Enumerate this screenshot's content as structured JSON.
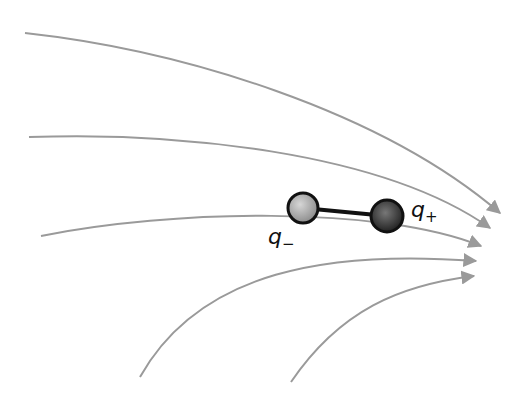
{
  "diagram": {
    "colors": {
      "field_line": "#9a9a9a",
      "rod": "#111111",
      "negative_charge": "#a8a8a8",
      "positive_charge": "#3a3a3a",
      "outline": "#111111"
    },
    "field_lines": [
      {
        "id": "line-1",
        "path": "M25,33 C180,50 380,110 500,213"
      },
      {
        "id": "line-2",
        "path": "M29,137 C170,132 380,150 490,228"
      },
      {
        "id": "line-3",
        "path": "M41,236 C170,210 380,205 481,246"
      },
      {
        "id": "line-4",
        "path": "M140,377 C200,270 330,250 476,261"
      },
      {
        "id": "line-5",
        "path": "M291,382 C340,310 400,285 474,276"
      }
    ],
    "charges": [
      {
        "id": "negative",
        "label": "q",
        "sub": "−",
        "cx": 303,
        "cy": 208,
        "r": 15
      },
      {
        "id": "positive",
        "label": "q",
        "sub": "+",
        "cx": 387,
        "cy": 216,
        "r": 16
      }
    ],
    "labels": {
      "negative_label": "q",
      "negative_sub": "−",
      "positive_label": "q",
      "positive_sub": "+"
    }
  }
}
